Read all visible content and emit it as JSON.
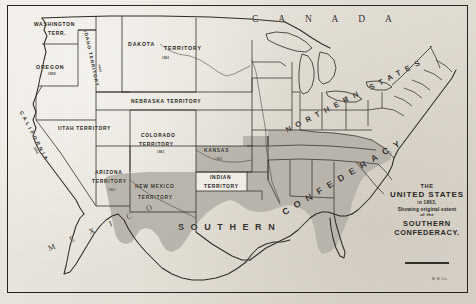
{
  "map": {
    "title_block": {
      "line1": "THE",
      "line2": "UNITED STATES",
      "line3": "in 1863,",
      "line4": "Showing original extent",
      "line5": "of the",
      "line6": "SOUTHERN",
      "line7": "CONFEDERACY."
    },
    "colophon": "W M Co.",
    "countries": [
      {
        "name": "canada-label",
        "text": "C A N A D A"
      },
      {
        "name": "mexico-label",
        "text": "M E X I C O"
      }
    ],
    "regions": [
      {
        "name": "northern-states-label",
        "text": "NORTHERN STATES"
      },
      {
        "name": "southern-label",
        "text": "SOUTHERN"
      },
      {
        "name": "confederacy-label",
        "text": "CONFEDERACY"
      }
    ],
    "territories": [
      {
        "name": "washington-territory",
        "line1": "WASHINGTON",
        "line2": "TERR.",
        "date": ""
      },
      {
        "name": "oregon-state",
        "line1": "OREGON",
        "line2": "",
        "date": "1859"
      },
      {
        "name": "idaho-territory",
        "line1": "IDAHO TERRITORY",
        "line2": "",
        "date": "1863"
      },
      {
        "name": "dakota-territory",
        "line1": "DAKOTA",
        "line2": "TERRITORY",
        "date": "1861"
      },
      {
        "name": "nebraska-territory",
        "line1": "NEBRASKA  TERRITORY",
        "line2": "",
        "date": ""
      },
      {
        "name": "utah-territory",
        "line1": "UTAH  TERRITORY",
        "line2": "",
        "date": ""
      },
      {
        "name": "colorado-territory",
        "line1": "COLORADO",
        "line2": "TERRITORY",
        "date": "1861"
      },
      {
        "name": "kansas-state",
        "line1": "KANSAS",
        "line2": "",
        "date": "1861"
      },
      {
        "name": "california-state",
        "line1": "CALIFORNIA",
        "line2": "",
        "date": "1850"
      },
      {
        "name": "arizona-territory",
        "line1": "ARIZONA",
        "line2": "TERRITORY",
        "date": "1863"
      },
      {
        "name": "new-mexico-territory",
        "line1": "NEW MEXICO",
        "line2": "TERRITORY",
        "date": ""
      },
      {
        "name": "indian-territory",
        "line1": "INDIAN",
        "line2": "TERRITORY",
        "date": ""
      }
    ],
    "colors": {
      "paper": "#e9e6df",
      "confederate_shading": "#b5b1a8",
      "ink": "#2b2724",
      "frame": "#262320"
    }
  }
}
